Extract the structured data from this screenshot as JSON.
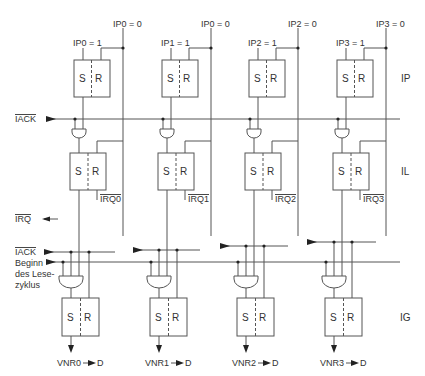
{
  "diagram": {
    "stage_labels": {
      "ip": "IP",
      "il": "IL",
      "ig": "IG"
    },
    "signals": {
      "iack_top": "IACK",
      "irq": "IRQ",
      "iack_bottom": "IACK",
      "read_cycle": [
        "Beginn",
        "des Lese-",
        "zyklus"
      ]
    },
    "flipflop": {
      "set": "S",
      "reset": "R"
    },
    "channels": [
      {
        "set_label": "IP0 = 1",
        "reset_label": "IP0 = 0",
        "irq_label": "IRQ0",
        "vnr_label": "VNR0",
        "out": "D"
      },
      {
        "set_label": "IP1 = 1",
        "reset_label": "IP0 = 0",
        "irq_label": "IRQ1",
        "vnr_label": "VNR1",
        "out": "D"
      },
      {
        "set_label": "IP2 = 1",
        "reset_label": "IP2 = 0",
        "irq_label": "IRQ2",
        "vnr_label": "VNR2",
        "out": "D"
      },
      {
        "set_label": "IP3 = 1",
        "reset_label": "IP3 = 0",
        "irq_label": "IRQ3",
        "vnr_label": "VNR3",
        "out": "D"
      }
    ]
  }
}
